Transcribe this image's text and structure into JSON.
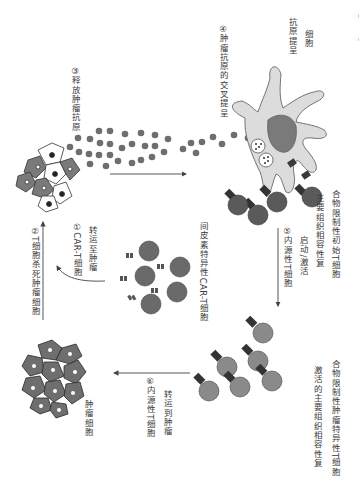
{
  "labels": {
    "step3": "③释放肿瘤抗原",
    "step4": "④肿瘤抗原的交叉提呈",
    "apc_line1": "抗原提呈",
    "apc_line2": "细胞",
    "step1_line1": "①CAR-T细胞",
    "step1_line2": "转运至肿瘤",
    "step2": "②T细胞杀死肿瘤细胞",
    "cart_label": "间皮素特异性CAR-T细胞",
    "step5_line1": "⑤内源性T细胞",
    "step5_line2": "启动/激活",
    "mhc_line1": "主要组织相容性复",
    "mhc_line2": "合物限制性初始T细胞",
    "tumor_label": "肿瘤细胞",
    "step6_line1": "⑥内源性T细胞",
    "step6_line2": "转运到肿瘤",
    "activated_line1": "激活的主要组织相容性复",
    "activated_line2": "合物限制性肿瘤特异性T细胞"
  },
  "colors": {
    "antigen": "#6e6e6e",
    "cell_dark": "#5a5a5a",
    "cell_mid": "#8a8a8a",
    "apc_fill": "#d9d9d9",
    "apc_nucleus": "#7a7a7a",
    "arrow": "#444444"
  }
}
